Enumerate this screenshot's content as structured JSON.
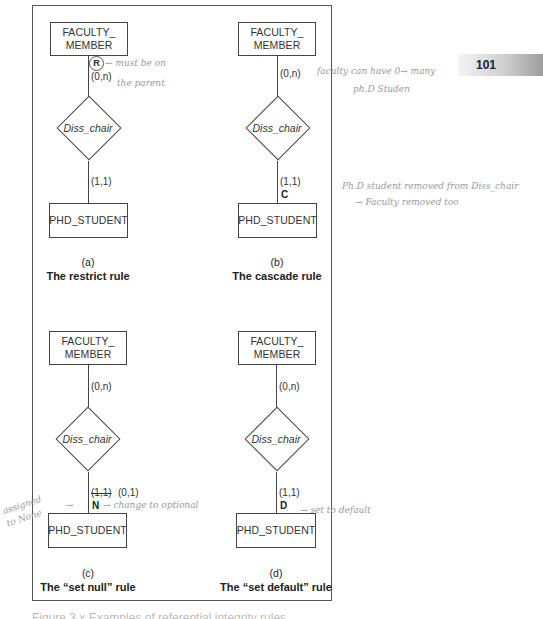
{
  "page": {
    "number": "101"
  },
  "figure": {
    "caption_partial": "Figure 3.x  Examples of referential integrity rules",
    "panels": [
      {
        "id": "a",
        "parent_entity": "FACULTY_\nMEMBER",
        "relationship": "Diss_chair",
        "child_entity": "PHD_STUDENT",
        "parent_cardinality": "(0,n)",
        "child_cardinality": "(1,1)",
        "rule_marker": "R",
        "label": "(a)",
        "title": "The restrict rule"
      },
      {
        "id": "b",
        "parent_entity": "FACULTY_\nMEMBER",
        "relationship": "Diss_chair",
        "child_entity": "PHD_STUDENT",
        "parent_cardinality": "(0,n)",
        "child_cardinality": "(1,1)",
        "rule_marker": "C",
        "label": "(b)",
        "title": "The cascade rule"
      },
      {
        "id": "c",
        "parent_entity": "FACULTY_\nMEMBER",
        "relationship": "Diss_chair",
        "child_entity": "PHD_STUDENT",
        "parent_cardinality": "(0,n)",
        "child_cardinality_struck": "(1,1)",
        "child_cardinality": "(0,1)",
        "rule_marker": "N",
        "label": "(c)",
        "title": "The “set null” rule"
      },
      {
        "id": "d",
        "parent_entity": "FACULTY_\nMEMBER",
        "relationship": "Diss_chair",
        "child_entity": "PHD_STUDENT",
        "parent_cardinality": "(0,n)",
        "child_cardinality": "(1,1)",
        "rule_marker": "D",
        "label": "(d)",
        "title": "The “set default” rule"
      }
    ]
  },
  "annotations": {
    "a_1": "← must be on",
    "a_2": "the parent",
    "b_1": "faculty can have 0→ many",
    "b_2": "ph.D Studen",
    "b_3": "Ph.D student removed from Diss_chair",
    "b_4": "→ Faculty removed too",
    "c_1": "→ change to optional",
    "c_2": "→",
    "c_3": "assigned",
    "c_4": "to None",
    "d_1": "→ set to default"
  }
}
